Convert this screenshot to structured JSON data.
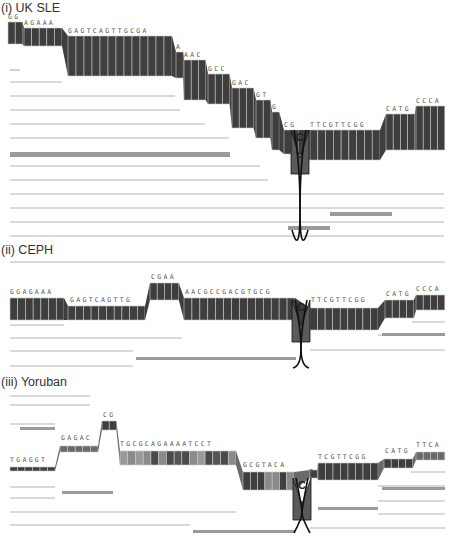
{
  "figure": {
    "width": 455,
    "height": 539,
    "colors": {
      "dark_band": "#3e3e3e",
      "mid_band": "#6a6a6a",
      "light_band": "#9a9a9a",
      "thin_line": "#b4b4b4",
      "divider": "#d8d8d8",
      "cross_line": "#111111"
    },
    "snp_label": "C"
  },
  "panels": [
    {
      "id": "uk-sle",
      "title": "(i) UK SLE",
      "title_y": 12,
      "segments": [
        {
          "label": "GG",
          "x1": 8,
          "x2": 20,
          "y1": 22,
          "y2": 44
        },
        {
          "label": "AGAAA",
          "x1": 24,
          "x2": 62,
          "y1": 28,
          "y2": 46
        },
        {
          "label": "GAGTCAGTTGCGA",
          "x1": 68,
          "x2": 172,
          "y1": 36,
          "y2": 76
        },
        {
          "label": "A",
          "x1": 176,
          "x2": 182,
          "y1": 52,
          "y2": 78
        },
        {
          "label": "AAC",
          "x1": 184,
          "x2": 204,
          "y1": 60,
          "y2": 100
        },
        {
          "label": "GCC",
          "x1": 208,
          "x2": 228,
          "y1": 74,
          "y2": 104
        },
        {
          "label": "GAC",
          "x1": 232,
          "x2": 252,
          "y1": 88,
          "y2": 128
        },
        {
          "label": "GT",
          "x1": 256,
          "x2": 268,
          "y1": 100,
          "y2": 138
        },
        {
          "label": "G",
          "x1": 272,
          "x2": 278,
          "y1": 112,
          "y2": 150
        },
        {
          "label": "CG",
          "x1": 284,
          "x2": 296,
          "y1": 130,
          "y2": 154
        },
        {
          "label": "TTCGTTCGG",
          "x1": 310,
          "x2": 380,
          "y1": 130,
          "y2": 160
        },
        {
          "label": "CATG",
          "x1": 386,
          "x2": 412,
          "y1": 114,
          "y2": 150
        },
        {
          "label": "CCCA",
          "x1": 416,
          "x2": 443,
          "y1": 106,
          "y2": 150
        }
      ],
      "snp": {
        "x": 300,
        "y_top": 130,
        "y_bottom": 150,
        "cross_y": 210
      },
      "thin_lines": [
        {
          "y": 70,
          "x1": 10,
          "x2": 20
        },
        {
          "y": 82,
          "x1": 10,
          "x2": 62
        },
        {
          "y": 96,
          "x1": 10,
          "x2": 175
        },
        {
          "y": 110,
          "x1": 10,
          "x2": 180
        },
        {
          "y": 124,
          "x1": 10,
          "x2": 205
        },
        {
          "y": 138,
          "x1": 10,
          "x2": 229
        },
        {
          "y": 166,
          "x1": 10,
          "x2": 260
        },
        {
          "y": 180,
          "x1": 10,
          "x2": 268
        },
        {
          "y": 194,
          "x1": 10,
          "x2": 444
        },
        {
          "y": 208,
          "x1": 10,
          "x2": 444
        },
        {
          "y": 222,
          "x1": 10,
          "x2": 444
        },
        {
          "y": 236,
          "x1": 10,
          "x2": 444
        }
      ],
      "grey_bands": [
        {
          "y": 152,
          "x1": 10,
          "x2": 230,
          "h": 5
        },
        {
          "y": 226,
          "x1": 288,
          "x2": 330,
          "h": 4
        },
        {
          "y": 212,
          "x1": 330,
          "x2": 392,
          "h": 4
        }
      ]
    },
    {
      "id": "ceph",
      "title": "(ii) CEPH",
      "title_y": 254,
      "segments": [
        {
          "label": "GGAGAAA",
          "x1": 10,
          "x2": 64,
          "y1": 298,
          "y2": 320
        },
        {
          "label": "GAGTCAGTTG",
          "x1": 68,
          "x2": 145,
          "y1": 306,
          "y2": 320
        },
        {
          "label": "CGAA",
          "x1": 150,
          "x2": 178,
          "y1": 283,
          "y2": 300
        },
        {
          "label": "AACGCCGACGTGCG",
          "x1": 184,
          "x2": 295,
          "y1": 298,
          "y2": 320
        },
        {
          "label": "TTCGTTCGG",
          "x1": 310,
          "x2": 378,
          "y1": 308,
          "y2": 330
        },
        {
          "label": "CATG",
          "x1": 385,
          "x2": 411,
          "y1": 300,
          "y2": 318
        },
        {
          "label": "CCCA",
          "x1": 416,
          "x2": 443,
          "y1": 295,
          "y2": 310
        }
      ],
      "labels": [
        {
          "text": "GGAGAAA",
          "x": 10,
          "y": 294
        },
        {
          "text": "GAGTCAGTTG",
          "x": 70,
          "y": 302
        },
        {
          "text": "CGAA",
          "x": 151,
          "y": 279
        },
        {
          "text": "AACGCCGACGTGCG",
          "x": 185,
          "y": 294
        },
        {
          "text": "TTCGTTCGG",
          "x": 311,
          "y": 302
        },
        {
          "text": "CATG",
          "x": 386,
          "y": 296
        },
        {
          "text": "CCCA",
          "x": 416,
          "y": 291
        }
      ],
      "snp": {
        "x": 301,
        "y_top": 300,
        "y_bottom": 318,
        "cross_y": 348
      },
      "thin_lines": [
        {
          "y": 262,
          "x1": 10,
          "x2": 445,
          "via": [
            145,
            253
          ]
        },
        {
          "y": 325,
          "x1": 10,
          "x2": 64
        },
        {
          "y": 338,
          "x1": 10,
          "x2": 182
        },
        {
          "y": 351,
          "x1": 10,
          "x2": 133
        },
        {
          "y": 366,
          "x1": 10,
          "x2": 133
        },
        {
          "y": 322,
          "x1": 412,
          "x2": 445
        },
        {
          "y": 335,
          "x1": 378,
          "x2": 445
        },
        {
          "y": 350,
          "x1": 310,
          "x2": 445
        }
      ],
      "grey_bands": [
        {
          "y": 357,
          "x1": 136,
          "x2": 296,
          "h": 3
        },
        {
          "y": 333,
          "x1": 382,
          "x2": 445,
          "h": 3
        }
      ]
    },
    {
      "id": "yoruban",
      "title": "(iii) Yoruban",
      "title_y": 386,
      "segments": [
        {
          "label": "TGAGGT",
          "x1": 10,
          "x2": 55,
          "y1": 467,
          "y2": 471
        },
        {
          "label": "GAGAC",
          "x1": 60,
          "x2": 98,
          "y1": 446,
          "y2": 452
        },
        {
          "label": "CG",
          "x1": 102,
          "x2": 114,
          "y1": 421,
          "y2": 430
        },
        {
          "label": "TGCGCAGAAAATCCT",
          "x1": 120,
          "x2": 236,
          "y1": 451,
          "y2": 465
        },
        {
          "label": "GCGTACA",
          "x1": 243,
          "x2": 294,
          "y1": 472,
          "y2": 490
        },
        {
          "label": "T",
          "x1": 310,
          "x2": 316,
          "y1": 470,
          "y2": 478
        },
        {
          "label": "TCGTTCGG",
          "x1": 318,
          "x2": 378,
          "y1": 463,
          "y2": 480
        },
        {
          "label": "CATG",
          "x1": 384,
          "x2": 411,
          "y1": 459,
          "y2": 468
        },
        {
          "label": "TTCA",
          "x1": 416,
          "x2": 443,
          "y1": 452,
          "y2": 460
        }
      ],
      "labels": [
        {
          "text": "TGAGGT",
          "x": 10,
          "y": 462
        },
        {
          "text": "GAGAC",
          "x": 61,
          "y": 440
        },
        {
          "text": "CG",
          "x": 103,
          "y": 417
        },
        {
          "text": "TGCGCAGAAAATCCT",
          "x": 120,
          "y": 446
        },
        {
          "text": "GCGTACA",
          "x": 243,
          "y": 467
        },
        {
          "text": "T",
          "x": 309,
          "y": 474
        },
        {
          "text": "TCGTTCGG",
          "x": 318,
          "y": 459
        },
        {
          "text": "CATG",
          "x": 385,
          "y": 453
        },
        {
          "text": "TTCA",
          "x": 416,
          "y": 447
        }
      ],
      "yoruban_cells": [
        "#9a9a9a",
        "#8a8a8a",
        "#9a9a9a",
        "#8a8a8a",
        "#4a4a4a",
        "#8a8a8a",
        "#4a4a4a",
        "#555555",
        "#4a4a4a",
        "#8a8a8a",
        "#9a9a9a",
        "#4a4a4a",
        "#555555",
        "#4a4a4a",
        "#8a8a8a"
      ],
      "snp": {
        "x": 302,
        "y_top": 478,
        "y_bottom": 496,
        "cross_y": 513
      },
      "thin_lines": [
        {
          "y": 396,
          "x1": 10,
          "x2": 90
        },
        {
          "y": 405,
          "x1": 10,
          "x2": 90
        },
        {
          "y": 424,
          "x1": 10,
          "x2": 55
        },
        {
          "y": 487,
          "x1": 10,
          "x2": 55
        },
        {
          "y": 498,
          "x1": 10,
          "x2": 55
        },
        {
          "y": 512,
          "x1": 10,
          "x2": 236
        },
        {
          "y": 525,
          "x1": 10,
          "x2": 190
        },
        {
          "y": 472,
          "x1": 411,
          "x2": 445
        },
        {
          "y": 486,
          "x1": 378,
          "x2": 445
        },
        {
          "y": 501,
          "x1": 378,
          "x2": 445
        },
        {
          "y": 514,
          "x1": 378,
          "x2": 445
        },
        {
          "y": 528,
          "x1": 310,
          "x2": 445
        }
      ],
      "grey_bands": [
        {
          "y": 427,
          "x1": 20,
          "x2": 55,
          "h": 3
        },
        {
          "y": 491,
          "x1": 62,
          "x2": 113,
          "h": 3
        },
        {
          "y": 530,
          "x1": 193,
          "x2": 295,
          "h": 3
        },
        {
          "y": 507,
          "x1": 318,
          "x2": 378,
          "h": 3
        },
        {
          "y": 487,
          "x1": 382,
          "x2": 445,
          "h": 3
        }
      ]
    }
  ]
}
